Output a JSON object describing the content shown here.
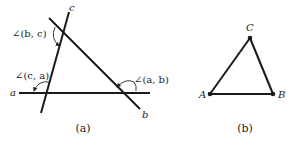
{
  "figure_a": {
    "caption": "(a)",
    "lines": [
      {
        "name": "a",
        "label": "a"
      },
      {
        "name": "b",
        "label": "b"
      },
      {
        "name": "c",
        "label": "c"
      }
    ],
    "angles": [
      {
        "name": "angle-b-c",
        "label": "∠(b, c)"
      },
      {
        "name": "angle-c-a",
        "label": "∠(c, a)"
      },
      {
        "name": "angle-a-b",
        "label": "∠(a, b)"
      }
    ]
  },
  "figure_b": {
    "caption": "(b)",
    "vertices": [
      {
        "name": "A",
        "label": "A"
      },
      {
        "name": "B",
        "label": "B"
      },
      {
        "name": "C",
        "label": "C"
      }
    ]
  },
  "colors": {
    "stroke": "#1a1a1a",
    "background": "#ffffff"
  }
}
